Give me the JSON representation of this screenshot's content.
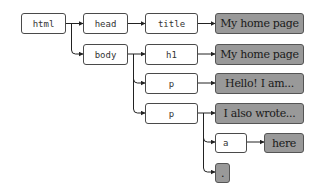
{
  "diagram": {
    "type": "dom-tree",
    "colors": {
      "tag_fill": "#ffffff",
      "text_fill": "#999999",
      "border": "#4a4a4a",
      "edge": "#222222"
    },
    "nodes": {
      "html": {
        "label": "html",
        "kind": "element"
      },
      "head": {
        "label": "head",
        "kind": "element"
      },
      "body": {
        "label": "body",
        "kind": "element"
      },
      "title": {
        "label": "title",
        "kind": "element"
      },
      "h1": {
        "label": "h1",
        "kind": "element"
      },
      "p1": {
        "label": "p",
        "kind": "element"
      },
      "p2": {
        "label": "p",
        "kind": "element"
      },
      "a": {
        "label": "a",
        "kind": "element"
      },
      "title_text": {
        "label": "My home page",
        "kind": "text"
      },
      "h1_text": {
        "label": "My home page",
        "kind": "text"
      },
      "p1_text": {
        "label": "Hello! I am...",
        "kind": "text"
      },
      "p2_text": {
        "label": "I also wrote...",
        "kind": "text"
      },
      "a_text": {
        "label": "here",
        "kind": "text"
      },
      "p2_tail": {
        "label": ".",
        "kind": "text"
      }
    },
    "edges": [
      [
        "html",
        "head"
      ],
      [
        "html",
        "body"
      ],
      [
        "head",
        "title"
      ],
      [
        "title",
        "title_text"
      ],
      [
        "body",
        "h1"
      ],
      [
        "body",
        "p1"
      ],
      [
        "body",
        "p2"
      ],
      [
        "h1",
        "h1_text"
      ],
      [
        "p1",
        "p1_text"
      ],
      [
        "p2",
        "p2_text"
      ],
      [
        "p2",
        "a"
      ],
      [
        "p2",
        "p2_tail"
      ],
      [
        "a",
        "a_text"
      ]
    ]
  }
}
